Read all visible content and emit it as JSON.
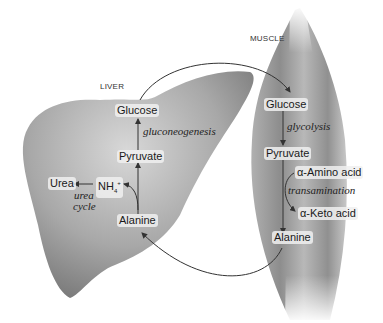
{
  "diagram": {
    "organs": {
      "liver": "LIVER",
      "muscle": "MUSCLE"
    },
    "liver": {
      "glucose": "Glucose",
      "gluconeogenesis": "gluconeogenesis",
      "pyruvate": "Pyruvate",
      "alanine": "Alanine",
      "nh4": "NH",
      "nh4_sub": "4",
      "nh4_sup": "+",
      "urea": "Urea",
      "urea_cycle_1": "urea",
      "urea_cycle_2": "cycle"
    },
    "muscle": {
      "glucose": "Glucose",
      "glycolysis": "glycolysis",
      "pyruvate": "Pyruvate",
      "amino_acid": "α-Amino acid",
      "transamination": "transamination",
      "keto_acid": "α-Keto acid",
      "alanine": "Alanine"
    },
    "colors": {
      "organ_fill": "#9a9a9a",
      "arrow": "#333333",
      "label_bg": "#efefef"
    }
  }
}
